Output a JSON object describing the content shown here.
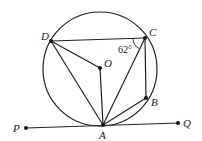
{
  "diagram": {
    "circle": {
      "cx": 100,
      "cy": 69,
      "r": 57
    },
    "points": {
      "D": {
        "x": 51,
        "y": 41,
        "label": "D",
        "lx": 41,
        "ly": 40
      },
      "C": {
        "x": 145,
        "y": 38,
        "label": "C",
        "lx": 149,
        "ly": 36
      },
      "O": {
        "x": 100,
        "y": 68,
        "label": "O",
        "lx": 104,
        "ly": 67
      },
      "B": {
        "x": 146,
        "y": 98,
        "label": "B",
        "lx": 151,
        "ly": 106
      },
      "A": {
        "x": 103,
        "y": 125,
        "label": "A",
        "lx": 99,
        "ly": 139
      },
      "P": {
        "x": 26,
        "y": 128,
        "label": "P",
        "lx": 13,
        "ly": 132
      },
      "Q": {
        "x": 178,
        "y": 123,
        "label": "Q",
        "lx": 183,
        "ly": 127
      }
    },
    "segments": [
      "DC",
      "DO",
      "OA",
      "DA",
      "CA",
      "CB",
      "BA",
      "PQ"
    ],
    "angle_label": {
      "text": "62°",
      "x": 118,
      "y": 53
    },
    "line_color": "#222222"
  }
}
